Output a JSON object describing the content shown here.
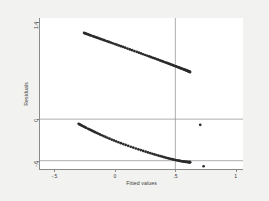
{
  "figure": {
    "background_color": "#f2f2f0",
    "plot_background_color": "#ffffff",
    "axis_color": "#8b8b8b",
    "marker_color": "#2b2b2b"
  },
  "chart_data": {
    "type": "scatter",
    "title": "",
    "xlabel": "Fitted values",
    "ylabel": "Residuals",
    "xlim": [
      -0.62,
      1.06
    ],
    "ylim": [
      -0.72,
      1.46
    ],
    "grid": false,
    "legend": null,
    "xticks": [
      -0.5,
      0,
      0.5,
      1
    ],
    "xtick_labels": [
      "-.5",
      "0",
      ".5",
      "1"
    ],
    "yticks": [
      1.4,
      0,
      -0.6
    ],
    "ytick_labels": [
      "1.4",
      "0",
      "-.6"
    ],
    "reference_lines": [
      {
        "orientation": "horizontal",
        "value": 0
      },
      {
        "orientation": "horizontal",
        "value": -0.6
      },
      {
        "orientation": "vertical",
        "value": 0.5
      }
    ],
    "series": [
      {
        "name": "upper band",
        "x": [
          -0.255,
          -0.248,
          -0.241,
          -0.234,
          -0.226,
          -0.217,
          -0.209,
          -0.2,
          -0.186,
          -0.177,
          -0.168,
          -0.158,
          -0.148,
          -0.138,
          -0.127,
          -0.116,
          -0.103,
          -0.09,
          -0.077,
          -0.063,
          -0.049,
          -0.034,
          -0.018,
          -0.002,
          0.014,
          0.031,
          0.049,
          0.067,
          0.085,
          0.104,
          0.123,
          0.142,
          0.161,
          0.18,
          0.198,
          0.216,
          0.234,
          0.251,
          0.268,
          0.284,
          0.3,
          0.315,
          0.33,
          0.344,
          0.358,
          0.371,
          0.384,
          0.396,
          0.408,
          0.419,
          0.43,
          0.441,
          0.451,
          0.461,
          0.47,
          0.479,
          0.488,
          0.497,
          0.505,
          0.513,
          0.521,
          0.529,
          0.536,
          0.543,
          0.55,
          0.557,
          0.563,
          0.569,
          0.575,
          0.581,
          0.587,
          0.592,
          0.597,
          0.602,
          0.607,
          0.611,
          0.615,
          0.618,
          0.62,
          0.622
        ],
        "y": [
          1.244,
          1.239,
          1.235,
          1.23,
          1.225,
          1.219,
          1.214,
          1.209,
          1.2,
          1.194,
          1.188,
          1.182,
          1.176,
          1.17,
          1.163,
          1.156,
          1.148,
          1.14,
          1.132,
          1.123,
          1.114,
          1.105,
          1.095,
          1.085,
          1.075,
          1.064,
          1.053,
          1.042,
          1.031,
          1.019,
          1.007,
          0.995,
          0.983,
          0.971,
          0.96,
          0.948,
          0.937,
          0.926,
          0.915,
          0.905,
          0.895,
          0.885,
          0.876,
          0.867,
          0.858,
          0.849,
          0.841,
          0.833,
          0.825,
          0.818,
          0.811,
          0.804,
          0.797,
          0.791,
          0.785,
          0.779,
          0.773,
          0.767,
          0.762,
          0.756,
          0.751,
          0.746,
          0.741,
          0.736,
          0.732,
          0.727,
          0.723,
          0.719,
          0.715,
          0.711,
          0.707,
          0.703,
          0.699,
          0.696,
          0.692,
          0.689,
          0.686,
          0.683,
          0.681,
          0.679
        ],
        "note": "descending band of tightly spaced points from upper-left to the vertical reference line; sparse/gapped at the left end, solid at the right end"
      },
      {
        "name": "lower band",
        "x": [
          -0.3,
          -0.292,
          -0.284,
          -0.276,
          -0.267,
          -0.258,
          -0.248,
          -0.238,
          -0.222,
          -0.211,
          -0.2,
          -0.189,
          -0.177,
          -0.165,
          -0.152,
          -0.139,
          -0.124,
          -0.109,
          -0.094,
          -0.078,
          -0.062,
          -0.045,
          -0.027,
          -0.009,
          0.01,
          0.029,
          0.049,
          0.069,
          0.089,
          0.11,
          0.131,
          0.152,
          0.173,
          0.194,
          0.214,
          0.234,
          0.254,
          0.273,
          0.292,
          0.31,
          0.327,
          0.344,
          0.36,
          0.376,
          0.391,
          0.405,
          0.419,
          0.432,
          0.445,
          0.457,
          0.469,
          0.48,
          0.491,
          0.501,
          0.511,
          0.52,
          0.529,
          0.538,
          0.546,
          0.554,
          0.562,
          0.569,
          0.576,
          0.583,
          0.589,
          0.595,
          0.6,
          0.605,
          0.61,
          0.614,
          0.617,
          0.62,
          0.622
        ],
        "y": [
          -0.068,
          -0.076,
          -0.083,
          -0.091,
          -0.099,
          -0.108,
          -0.116,
          -0.125,
          -0.139,
          -0.148,
          -0.158,
          -0.167,
          -0.177,
          -0.188,
          -0.198,
          -0.209,
          -0.221,
          -0.233,
          -0.245,
          -0.257,
          -0.269,
          -0.282,
          -0.295,
          -0.308,
          -0.321,
          -0.334,
          -0.347,
          -0.36,
          -0.373,
          -0.386,
          -0.399,
          -0.411,
          -0.424,
          -0.436,
          -0.447,
          -0.459,
          -0.47,
          -0.48,
          -0.49,
          -0.5,
          -0.509,
          -0.518,
          -0.526,
          -0.534,
          -0.541,
          -0.548,
          -0.555,
          -0.561,
          -0.567,
          -0.572,
          -0.577,
          -0.582,
          -0.586,
          -0.59,
          -0.594,
          -0.597,
          -0.6,
          -0.603,
          -0.606,
          -0.608,
          -0.61,
          -0.612,
          -0.614,
          -0.616,
          -0.617,
          -0.618,
          -0.619,
          -0.62,
          -0.62,
          -0.621,
          -0.621,
          -0.621,
          -0.621
        ],
        "note": "second descending band below the zero line, ending at the vertical reference line near -.6"
      },
      {
        "name": "outliers",
        "x": [
          0.706,
          0.734
        ],
        "y": [
          -0.082,
          -0.68
        ],
        "note": "two isolated points to the right of the vertical reference line"
      }
    ]
  }
}
